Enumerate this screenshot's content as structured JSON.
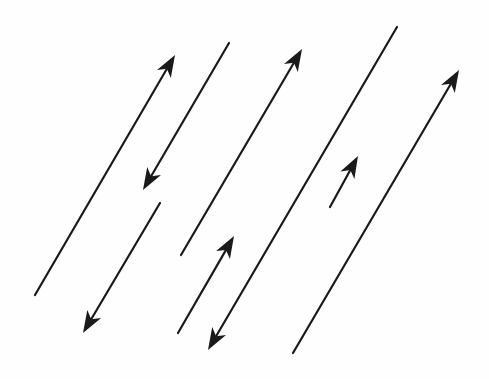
{
  "diagram": {
    "title": "",
    "width": 489,
    "height": 379,
    "background": "#fefefe",
    "stroke_color": "#1a1a1a",
    "stroke_width": 2.2,
    "arrowhead": {
      "length": 22,
      "half_width": 8,
      "notch": 6
    },
    "lines": [
      {
        "id": "line-1",
        "x1": 35,
        "y1": 295,
        "x2": 175,
        "y2": 55,
        "arrow": "end"
      },
      {
        "id": "line-2",
        "x1": 229,
        "y1": 43,
        "x2": 143,
        "y2": 190,
        "arrow": "end"
      },
      {
        "id": "line-3",
        "x1": 160,
        "y1": 203,
        "x2": 83,
        "y2": 333,
        "arrow": "end"
      },
      {
        "id": "line-4",
        "x1": 181,
        "y1": 255,
        "x2": 302,
        "y2": 49,
        "arrow": "end"
      },
      {
        "id": "line-5",
        "x1": 178,
        "y1": 333,
        "x2": 234,
        "y2": 236,
        "arrow": "end"
      },
      {
        "id": "line-6",
        "x1": 397,
        "y1": 27,
        "x2": 208,
        "y2": 350,
        "arrow": "end"
      },
      {
        "id": "line-7",
        "x1": 330,
        "y1": 207,
        "x2": 358,
        "y2": 156,
        "arrow": "end"
      },
      {
        "id": "line-8",
        "x1": 293,
        "y1": 353,
        "x2": 459,
        "y2": 70,
        "arrow": "end"
      }
    ]
  }
}
